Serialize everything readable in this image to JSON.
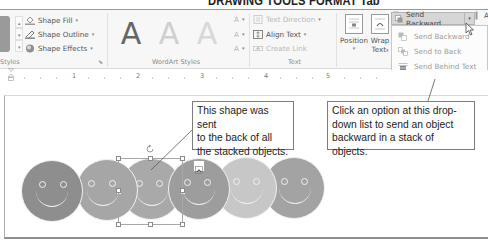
{
  "caption": "DRAWING TOOLS FORMAT Tab",
  "ribbon": {
    "groups": {
      "shape_styles": {
        "label": "Styles",
        "commands": [
          {
            "label": "Shape Fill",
            "icon": "paint-bucket-icon",
            "dropdown": "▾"
          },
          {
            "label": "Shape Outline",
            "icon": "pencil-outline-icon",
            "dropdown": "▾"
          },
          {
            "label": "Shape Effects",
            "icon": "shape-effects-icon",
            "dropdown": "▾"
          }
        ],
        "launcher": "⬊"
      },
      "wordart_styles": {
        "label": "WordArt Styles",
        "letters": [
          "A",
          "A",
          "A"
        ],
        "letter_colors": [
          "#666666",
          "#cfcfcf",
          "#d8d8d8"
        ],
        "side_buttons": [
          "A",
          "A",
          "A"
        ]
      },
      "text": {
        "label": "Text",
        "commands": [
          {
            "label": "Text Direction",
            "disabled": true,
            "dropdown": "▾"
          },
          {
            "label": "Align Text",
            "disabled": false,
            "dropdown": "▾"
          },
          {
            "label": "Create Link",
            "disabled": true
          }
        ]
      },
      "arrange": {
        "position_label": "Position",
        "position_dropdown": "▾",
        "wrap_text_label_1": "Wrap",
        "wrap_text_label_2": "Text",
        "wrap_dropdown": "▾",
        "bring_forward": "Bring Forward",
        "bring_forward_dropdown": "▾",
        "send_backward": "Send Backward",
        "send_backward_dropdown": "▾",
        "align_partial": "A",
        "group_partial": "G"
      }
    },
    "dropdown_menu": {
      "items": [
        {
          "label": "Send Backward",
          "icon": "send-backward-icon"
        },
        {
          "label": "Send to Back",
          "icon": "send-to-back-icon"
        },
        {
          "label": "Send Behind Text",
          "icon": "send-behind-text-icon"
        }
      ]
    }
  },
  "ruler": {
    "numbers": [
      "1",
      "2",
      "3",
      "4",
      "5"
    ]
  },
  "document": {
    "faces": [
      {
        "color": "#8e8e8e"
      },
      {
        "color": "#a6a6a6"
      },
      {
        "color": "#a9a9a9"
      },
      {
        "color": "#9d9d9d"
      },
      {
        "color": "#c7c7c7"
      },
      {
        "color": "#a3a3a3"
      }
    ]
  },
  "callouts": {
    "left": [
      "This shape was sent",
      "to the back of all",
      "the stacked objects."
    ],
    "right": [
      "Click an option at this drop-",
      "down list to send an object",
      "backward in a stack of objects."
    ]
  },
  "colors": {
    "ribbon_bg": "#f7f7f7",
    "selected_button": "#d6d6d6",
    "disabled_text": "#9b9b9b",
    "callout_border": "#7d7d7d"
  }
}
